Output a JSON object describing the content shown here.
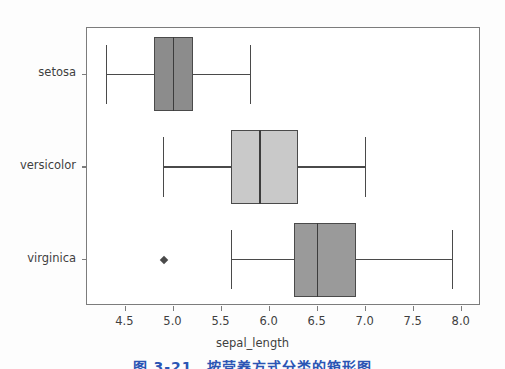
{
  "figure": {
    "background_color": "#fdfdfd",
    "plot_background_color": "#ffffff",
    "frame_color": "#7c7c7c",
    "xaxis_title": "sepal_length",
    "caption_partial": "图 3-21　按营养方式分类的箱形图",
    "caption_color": "#2b55b4"
  },
  "chart_data": {
    "type": "box",
    "orientation": "horizontal",
    "title": "",
    "xlabel": "sepal_length",
    "ylabel": "",
    "xlim": [
      4.1,
      8.2
    ],
    "grid": false,
    "legend": null,
    "xticks": [
      "4.5",
      "5.0",
      "5.5",
      "6.0",
      "6.5",
      "7.0",
      "7.5",
      "8.0"
    ],
    "xtick_values": [
      4.5,
      5.0,
      5.5,
      6.0,
      6.5,
      7.0,
      7.5,
      8.0
    ],
    "categories": [
      "setosa",
      "versicolor",
      "virginica"
    ],
    "boxes": [
      {
        "label": "setosa",
        "whisker_low": 4.3,
        "q1": 4.8,
        "median": 5.0,
        "q3": 5.2,
        "whisker_high": 5.8,
        "outliers": [],
        "fill_color": "#8c8c8c",
        "edge_color": "#4a4a4a"
      },
      {
        "label": "versicolor",
        "whisker_low": 4.9,
        "q1": 5.6,
        "median": 5.9,
        "q3": 6.3,
        "whisker_high": 7.0,
        "outliers": [],
        "fill_color": "#c9c9c9",
        "edge_color": "#4a4a4a"
      },
      {
        "label": "virginica",
        "whisker_low": 5.6,
        "q1": 6.25,
        "median": 6.5,
        "q3": 6.9,
        "whisker_high": 7.9,
        "outliers": [
          4.9
        ],
        "fill_color": "#9a9a9a",
        "edge_color": "#4a4a4a"
      }
    ]
  }
}
